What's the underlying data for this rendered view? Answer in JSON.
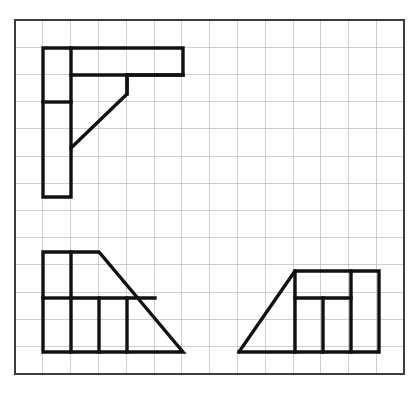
{
  "drawing": {
    "title": "Orthographic Multiview Drawing",
    "description": "Three-view engineering sketch on graph paper: top view, front view and right-side view of a bracket",
    "background_color": "#ffffff",
    "line_color": "#111111",
    "grid_color": "#b9b9c2",
    "frame_color": "#3b3b44",
    "line_width": 3.4,
    "grid": {
      "origin_x": 15,
      "origin_y": 20,
      "cell_width": 27.8,
      "cell_height": 27.2,
      "columns": 14,
      "rows": 13,
      "frame_left": 15,
      "frame_top": 20,
      "frame_right": 404,
      "frame_bottom": 374
    },
    "views": [
      {
        "name": "top-view",
        "label": "Top view",
        "position": "upper-left",
        "outline": "43,48 183,48 183,75 127,75 127,94 71,148 71,197 43,197 43,48",
        "inner_segments": [
          "71,48 71,148",
          "71,75 183,75",
          "71,102 43,102",
          "127,75 127,94"
        ]
      },
      {
        "name": "front-view",
        "label": "Front view",
        "position": "lower-left",
        "outline": "43,252 99,252 183,352 43,352 43,252",
        "inner_segments": [
          "71,252 71,352",
          "71,298 155,298",
          "99,298 99,352",
          "127,298 127,352",
          "43,298 71,298"
        ]
      },
      {
        "name": "side-view",
        "label": "Right side view",
        "position": "lower-right",
        "outline": "239,352 295,271 379,271 379,352 239,352",
        "inner_segments": [
          "295,298 351,298",
          "295,271 295,352",
          "323,298 323,352",
          "351,271 351,352"
        ]
      }
    ]
  }
}
